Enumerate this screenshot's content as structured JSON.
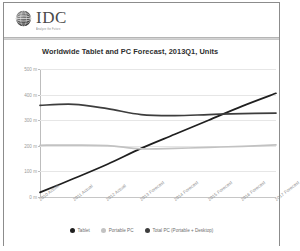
{
  "brand": {
    "name": "IDC",
    "tagline": "Analyze the Future",
    "logo_icon": "globe-icon"
  },
  "chart_data": {
    "type": "line",
    "title": "Worldwide Tablet and PC Forecast, 2013Q1, Units",
    "xlabel": "",
    "ylabel": "",
    "ylim": [
      0,
      500
    ],
    "grid": true,
    "legend_position": "bottom",
    "categories": [
      "2010 Actual",
      "2011 Actual",
      "2012 Actual",
      "2013 Forecast",
      "2014 Forecast",
      "2015 Forecast",
      "2016 Forecast",
      "2017 Forecast"
    ],
    "ytick_labels": [
      "500 m",
      "400 m",
      "300 m",
      "200 m",
      "100 m",
      "0 m"
    ],
    "ytick_values": [
      500,
      400,
      300,
      200,
      100,
      0
    ],
    "series": [
      {
        "name": "Tablet",
        "color": "#1f1f1f",
        "values": [
          18,
          72,
          128,
          190,
          245,
          300,
          355,
          405
        ]
      },
      {
        "name": "Portable PC",
        "color": "#c2c2c2",
        "values": [
          202,
          203,
          201,
          188,
          190,
          194,
          198,
          204
        ]
      },
      {
        "name": "Total PC (Portable + Desktop)",
        "color": "#3d3d3d",
        "values": [
          358,
          362,
          345,
          322,
          318,
          322,
          326,
          328
        ]
      }
    ]
  }
}
